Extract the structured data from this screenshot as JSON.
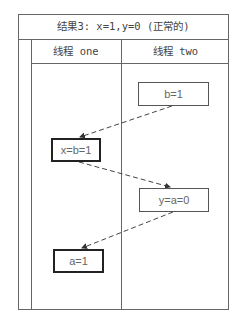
{
  "title": "结果3: x=1,y=0 (正常的)",
  "columns": [
    {
      "label": "线程 one"
    },
    {
      "label": "线程 two"
    }
  ],
  "nodes": [
    {
      "id": "b1",
      "label": "b=1",
      "thread": "two",
      "emphasis": false
    },
    {
      "id": "xb1",
      "label": "x=b=1",
      "thread": "one",
      "emphasis": true
    },
    {
      "id": "ya0",
      "label": "y=a=0",
      "thread": "two",
      "emphasis": false
    },
    {
      "id": "a1",
      "label": "a=1",
      "thread": "one",
      "emphasis": true
    }
  ],
  "edges": [
    {
      "from": "b1",
      "to": "xb1",
      "style": "dashed"
    },
    {
      "from": "xb1",
      "to": "ya0",
      "style": "dashed"
    },
    {
      "from": "ya0",
      "to": "a1",
      "style": "dashed"
    }
  ],
  "colors": {
    "border": "#666666",
    "emphasis_border": "#222222",
    "text": "#555555"
  }
}
